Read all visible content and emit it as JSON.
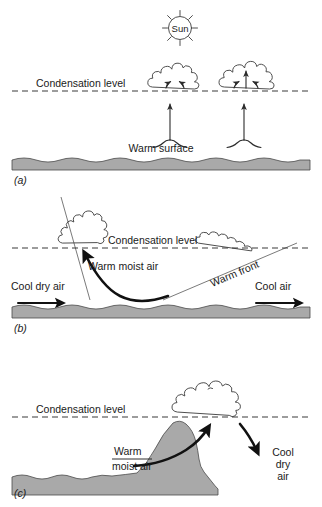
{
  "figure": {
    "background_color": "#ffffff",
    "ground_fill_color": "#a9a9a9",
    "line_color": "#3b3b3b",
    "panels": [
      {
        "id": "a",
        "panel_label": "(a)",
        "mechanism": "convective-lifting",
        "labels": {
          "sun": "Sun",
          "condensation_level": "Condensation level",
          "surface": "Warm surface"
        },
        "icons": [
          "sun-icon",
          "cumulus-cloud-icon",
          "updraft-arrow-icon"
        ]
      },
      {
        "id": "b",
        "panel_label": "(b)",
        "mechanism": "frontal-lifting",
        "labels": {
          "condensation_level": "Condensation level",
          "warm_moist_air": "Warm moist air",
          "warm_front": "Warm front",
          "cool_dry_air": "Cool dry air",
          "cool_air": "Cool air"
        },
        "icons": [
          "cumulus-cloud-icon",
          "stratus-cloud-icon",
          "cold-front-line-icon",
          "warm-front-line-icon",
          "flow-arrow-icon"
        ]
      },
      {
        "id": "c",
        "panel_label": "(c)",
        "mechanism": "orographic-lifting",
        "labels": {
          "condensation_level": "Condensation level",
          "warm": "Warm",
          "moist_air": "moist air",
          "cool": "Cool",
          "dry": "dry",
          "air": "air"
        },
        "icons": [
          "cumulus-cloud-icon",
          "mountain-icon",
          "upslope-arrow-icon",
          "downslope-arrow-icon"
        ]
      }
    ]
  }
}
